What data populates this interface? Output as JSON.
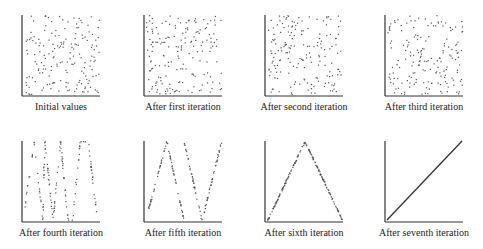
{
  "figure": {
    "panels": [
      {
        "label": "Initial values",
        "type": "scatter",
        "pattern": "random",
        "n": 170,
        "seed": 11
      },
      {
        "label": "After first iteration",
        "type": "scatter",
        "pattern": "random",
        "n": 170,
        "seed": 23
      },
      {
        "label": "After second iteration",
        "type": "scatter",
        "pattern": "random",
        "n": 170,
        "seed": 37
      },
      {
        "label": "After third iteration",
        "type": "scatter",
        "pattern": "random",
        "n": 170,
        "seed": 51
      },
      {
        "label": "After fourth iteration",
        "type": "scatter",
        "pattern": "zigzag",
        "n": 150,
        "seed": 61,
        "vertices": [
          [
            0,
            0.15
          ],
          [
            0.13,
            1.0
          ],
          [
            0.24,
            0.0
          ],
          [
            0.27,
            1.0
          ],
          [
            0.38,
            0.0
          ],
          [
            0.48,
            1.0
          ],
          [
            0.58,
            0.0
          ],
          [
            0.64,
            0.0
          ],
          [
            0.74,
            1.0
          ],
          [
            0.85,
            1.0
          ],
          [
            0.96,
            0.1
          ]
        ]
      },
      {
        "label": "After fifth iteration",
        "type": "scatter",
        "pattern": "polyline",
        "n": 150,
        "seed": 71,
        "segments": [
          [
            [
              0,
              0.05
            ],
            [
              0.27,
              1.0
            ],
            [
              0.5,
              0.0
            ]
          ],
          [
            [
              0.5,
              1.0
            ],
            [
              0.74,
              0.0
            ],
            [
              1.0,
              1.0
            ]
          ]
        ]
      },
      {
        "label": "After sixth iteration",
        "type": "scatter",
        "pattern": "polyline",
        "n": 170,
        "seed": 83,
        "segments": [
          [
            [
              0,
              0.0
            ],
            [
              0.5,
              1.0
            ],
            [
              1.0,
              0.0
            ]
          ]
        ]
      },
      {
        "label": "After seventh iteration",
        "type": "line",
        "pattern": "polyline",
        "n": 0,
        "seed": 0,
        "segments": [
          [
            [
              0,
              0.0
            ],
            [
              1.0,
              1.0
            ]
          ]
        ]
      }
    ]
  },
  "chart_data": [
    {
      "type": "scatter",
      "title": "Initial values",
      "xlabel": "",
      "ylabel": "",
      "xlim": [
        0,
        1
      ],
      "ylim": [
        0,
        1
      ],
      "description": "uniformly random points filling unit square",
      "grid": false
    },
    {
      "type": "scatter",
      "title": "After first iteration",
      "xlabel": "",
      "ylabel": "",
      "xlim": [
        0,
        1
      ],
      "ylim": [
        0,
        1
      ],
      "description": "uniformly random points",
      "grid": false
    },
    {
      "type": "scatter",
      "title": "After second iteration",
      "xlabel": "",
      "ylabel": "",
      "xlim": [
        0,
        1
      ],
      "ylim": [
        0,
        1
      ],
      "description": "uniformly random points",
      "grid": false
    },
    {
      "type": "scatter",
      "title": "After third iteration",
      "xlabel": "",
      "ylabel": "",
      "xlim": [
        0,
        1
      ],
      "ylim": [
        0,
        1
      ],
      "description": "uniformly random points",
      "grid": false
    },
    {
      "type": "scatter",
      "title": "After fourth iteration",
      "xlabel": "",
      "ylabel": "",
      "xlim": [
        0,
        1
      ],
      "ylim": [
        0,
        1
      ],
      "description": "points align along several steep zigzag segments",
      "grid": false
    },
    {
      "type": "scatter",
      "title": "After fifth iteration",
      "xlabel": "",
      "ylabel": "",
      "xlim": [
        0,
        1
      ],
      "ylim": [
        0,
        1
      ],
      "description": "points on two V/tent segments: (0,0)->(0.27,1)->(0.5,0) and (0.5,1)->(0.74,0)->(1,1)",
      "grid": false
    },
    {
      "type": "scatter",
      "title": "After sixth iteration",
      "xlabel": "",
      "ylabel": "",
      "xlim": [
        0,
        1
      ],
      "ylim": [
        0,
        1
      ],
      "description": "points on tent map (0,0)->(0.5,1)->(1,0)",
      "grid": false
    },
    {
      "type": "line",
      "title": "After seventh iteration",
      "xlabel": "",
      "ylabel": "",
      "xlim": [
        0,
        1
      ],
      "ylim": [
        0,
        1
      ],
      "x": [
        0,
        1
      ],
      "y": [
        0,
        1
      ],
      "description": "points collapse to identity line y=x",
      "grid": false
    }
  ],
  "layout": {
    "rows": [
      {
        "axis_top": 15,
        "axis_bottom": 96,
        "label_y": 110
      },
      {
        "axis_top": 141,
        "axis_bottom": 222,
        "label_y": 236
      }
    ],
    "cols": [
      {
        "axis_left": 22,
        "axis_right": 100
      },
      {
        "axis_left": 144,
        "axis_right": 222
      },
      {
        "axis_left": 265,
        "axis_right": 343
      },
      {
        "axis_left": 385,
        "axis_right": 463
      }
    ],
    "point_color": "#555555",
    "axis_color": "#333333"
  }
}
